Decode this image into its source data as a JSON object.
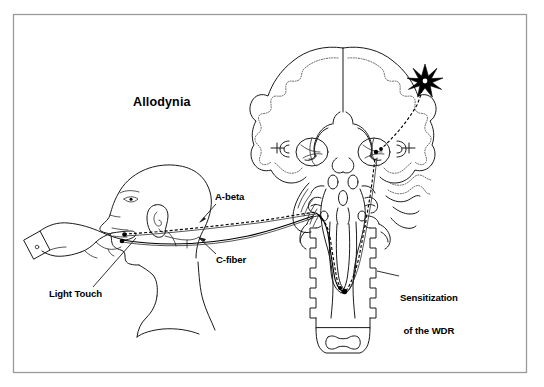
{
  "figure": {
    "title": "Allodynia",
    "frame_color": "#9a9a9a",
    "background_color": "#ffffff",
    "ink_color": "#1a1a1a",
    "type": "anatomical-diagram"
  },
  "labels": {
    "title": "Allodynia",
    "a_beta": "A-beta",
    "c_fiber": "C-fiber",
    "light_touch": "Light Touch",
    "sensitization_line1": "Sensitization",
    "sensitization_line2": "of the WDR"
  },
  "anatomy": {
    "head": "head-profile-facing-left",
    "hand": "hand-with-pointing-finger-and-shirt-cuff",
    "brain": "coronal-brain-section-with-dotted-cortex",
    "brainstem": "brainstem-and-spinal-cord",
    "cerebellum": "cerebellum-with-folia",
    "thalamus": "thalamus-oval-nuclei",
    "vertebra": "vertebra-cross-section",
    "star": "cortical-activation-starburst"
  },
  "pathways": {
    "a_beta_style": "dashed",
    "c_fiber_style": "solid",
    "ascending_tract_style": "dashed",
    "a_beta_description": "A-beta fiber from face to brainstem, drawn dashed",
    "c_fiber_description": "C-fiber from face to spinal trigeminal nucleus, drawn solid",
    "ascending_description": "Sensitized ascending tract from WDR neuron through thalamus to cortex"
  }
}
